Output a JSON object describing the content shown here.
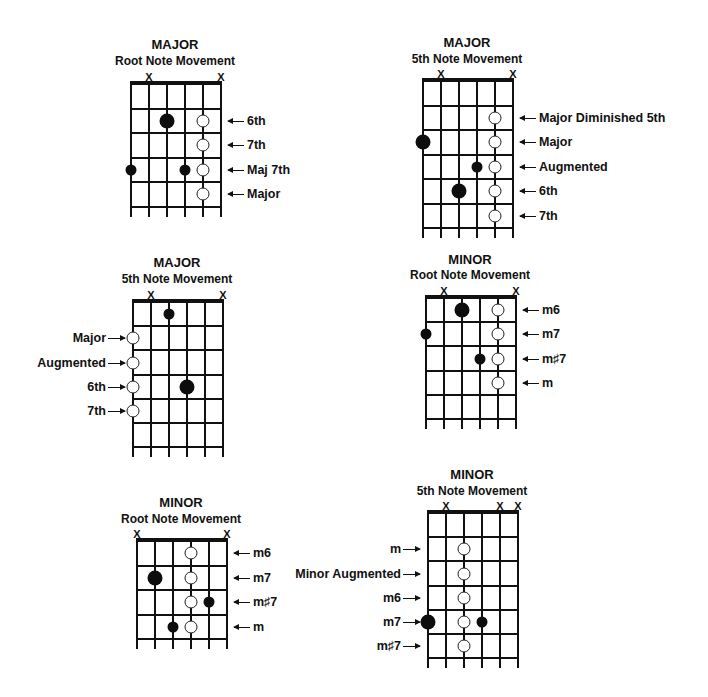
{
  "diagrams": [
    {
      "id": "major-root",
      "title": "MAJOR",
      "subtitle": "Root Note Movement",
      "x0": 130,
      "nutY": 83,
      "stringGap": 18,
      "fretGap": 24.5,
      "frets": 5,
      "tail": 11,
      "titleY": 38,
      "subtitleY": 54,
      "xmarkY": 71,
      "muted": [
        1,
        5
      ],
      "filled": [
        {
          "string": 2,
          "fret": 2,
          "size": 15
        },
        {
          "string": 0,
          "fret": 4,
          "size": 11
        },
        {
          "string": 3,
          "fret": 4,
          "size": 11
        }
      ],
      "open": [
        {
          "string": 4,
          "fret": 2
        },
        {
          "string": 4,
          "fret": 3
        },
        {
          "string": 4,
          "fret": 4
        },
        {
          "string": 4,
          "fret": 5
        }
      ],
      "labels": [
        {
          "text": "6th",
          "fret": 2,
          "side": "right"
        },
        {
          "text": "7th",
          "fret": 3,
          "side": "right"
        },
        {
          "text": "Maj 7th",
          "fret": 4,
          "side": "right"
        },
        {
          "text": "Major",
          "fret": 5,
          "side": "right"
        }
      ]
    },
    {
      "id": "major-5th",
      "title": "MAJOR",
      "subtitle": "5th Note Movement",
      "x0": 422,
      "nutY": 80,
      "stringGap": 18,
      "fretGap": 24.5,
      "frets": 6,
      "tail": 11,
      "titleY": 36,
      "subtitleY": 52,
      "xmarkY": 68,
      "muted": [
        1,
        5
      ],
      "filled": [
        {
          "string": 0,
          "fret": 3,
          "size": 15
        },
        {
          "string": 3,
          "fret": 4,
          "size": 11
        },
        {
          "string": 2,
          "fret": 5,
          "size": 15
        }
      ],
      "open": [
        {
          "string": 4,
          "fret": 2
        },
        {
          "string": 4,
          "fret": 3
        },
        {
          "string": 4,
          "fret": 4
        },
        {
          "string": 4,
          "fret": 5
        },
        {
          "string": 4,
          "fret": 6
        }
      ],
      "labels": [
        {
          "text": "Major Diminished 5th",
          "fret": 2,
          "side": "right"
        },
        {
          "text": "Major",
          "fret": 3,
          "side": "right"
        },
        {
          "text": "Augmented",
          "fret": 4,
          "side": "right"
        },
        {
          "text": "6th",
          "fret": 5,
          "side": "right"
        },
        {
          "text": "7th",
          "fret": 6,
          "side": "right"
        }
      ]
    },
    {
      "id": "major-5th-low",
      "title": "MAJOR",
      "subtitle": "5th Note Movement",
      "x0": 132,
      "nutY": 301,
      "stringGap": 18,
      "fretGap": 24.2,
      "frets": 6,
      "tail": 11,
      "titleY": 256,
      "subtitleY": 272,
      "xmarkY": 289,
      "muted": [
        1,
        5
      ],
      "filled": [
        {
          "string": 2,
          "fret": 1,
          "size": 11
        },
        {
          "string": 3,
          "fret": 4,
          "size": 15
        }
      ],
      "open": [
        {
          "string": 0,
          "fret": 2
        },
        {
          "string": 0,
          "fret": 3
        },
        {
          "string": 0,
          "fret": 4
        },
        {
          "string": 0,
          "fret": 5
        }
      ],
      "labels": [
        {
          "text": "Major",
          "fret": 2,
          "side": "left"
        },
        {
          "text": "Augmented",
          "fret": 3,
          "side": "left"
        },
        {
          "text": "6th",
          "fret": 4,
          "side": "left"
        },
        {
          "text": "7th",
          "fret": 5,
          "side": "left"
        }
      ]
    },
    {
      "id": "minor-root",
      "title": "MINOR",
      "subtitle": "Root Note Movement",
      "x0": 425,
      "nutY": 297,
      "stringGap": 18,
      "fretGap": 24.2,
      "frets": 5,
      "tail": 11,
      "titleY": 253,
      "subtitleY": 268,
      "xmarkY": 285,
      "muted": [
        1,
        5
      ],
      "filled": [
        {
          "string": 2,
          "fret": 1,
          "size": 15
        },
        {
          "string": 0,
          "fret": 2,
          "size": 11
        },
        {
          "string": 3,
          "fret": 3,
          "size": 11
        }
      ],
      "open": [
        {
          "string": 4,
          "fret": 1
        },
        {
          "string": 4,
          "fret": 2
        },
        {
          "string": 4,
          "fret": 3
        },
        {
          "string": 4,
          "fret": 4
        }
      ],
      "labels": [
        {
          "text": "m6",
          "fret": 1,
          "side": "right"
        },
        {
          "text": "m7",
          "fret": 2,
          "side": "right"
        },
        {
          "text": "m♯7",
          "fret": 3,
          "side": "right"
        },
        {
          "text": "m",
          "fret": 4,
          "side": "right"
        }
      ]
    },
    {
      "id": "minor-root-low",
      "title": "MINOR",
      "subtitle": "Root Note Movement",
      "x0": 136,
      "nutY": 540,
      "stringGap": 18,
      "fretGap": 24.5,
      "frets": 4,
      "tail": 11,
      "titleY": 496,
      "subtitleY": 512,
      "xmarkY": 528,
      "muted": [
        0,
        5
      ],
      "filled": [
        {
          "string": 1,
          "fret": 2,
          "size": 15
        },
        {
          "string": 4,
          "fret": 3,
          "size": 11
        },
        {
          "string": 2,
          "fret": 4,
          "size": 11
        }
      ],
      "open": [
        {
          "string": 3,
          "fret": 1
        },
        {
          "string": 3,
          "fret": 2
        },
        {
          "string": 3,
          "fret": 3
        },
        {
          "string": 3,
          "fret": 4
        }
      ],
      "labels": [
        {
          "text": "m6",
          "fret": 1,
          "side": "right"
        },
        {
          "text": "m7",
          "fret": 2,
          "side": "right"
        },
        {
          "text": "m♯7",
          "fret": 3,
          "side": "right"
        },
        {
          "text": "m",
          "fret": 4,
          "side": "right"
        }
      ]
    },
    {
      "id": "minor-5th",
      "title": "MINOR",
      "subtitle": "5th Note Movement",
      "x0": 427,
      "nutY": 512,
      "stringGap": 18,
      "fretGap": 24.2,
      "frets": 6,
      "tail": 11,
      "titleY": 468,
      "subtitleY": 484,
      "xmarkY": 500,
      "muted": [
        1,
        4,
        5
      ],
      "filled": [
        {
          "string": 0,
          "fret": 5,
          "size": 15
        },
        {
          "string": 3,
          "fret": 5,
          "size": 11
        }
      ],
      "open": [
        {
          "string": 2,
          "fret": 2
        },
        {
          "string": 2,
          "fret": 3
        },
        {
          "string": 2,
          "fret": 4
        },
        {
          "string": 2,
          "fret": 5
        },
        {
          "string": 2,
          "fret": 6
        }
      ],
      "labels": [
        {
          "text": "m",
          "fret": 2,
          "side": "left"
        },
        {
          "text": "Minor Augmented",
          "fret": 3,
          "side": "left"
        },
        {
          "text": "m6",
          "fret": 4,
          "side": "left"
        },
        {
          "text": "m7",
          "fret": 5,
          "side": "left"
        },
        {
          "text": "m♯7",
          "fret": 6,
          "side": "left"
        }
      ]
    }
  ],
  "symbols": {
    "muted": "X"
  },
  "colors": {
    "ink": "#111111",
    "background": "#ffffff"
  }
}
